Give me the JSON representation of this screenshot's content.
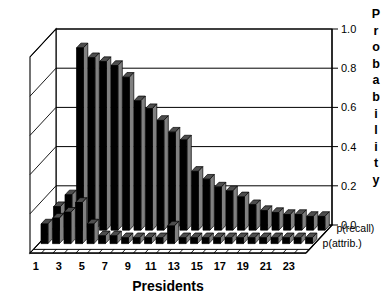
{
  "chart_data": {
    "type": "bar",
    "title": "",
    "subtitle": "",
    "xlabel": "Presidents",
    "ylabel": "Probability",
    "ylim": [
      0.0,
      1.0
    ],
    "yticks": [
      "1.0",
      "0.8",
      "0.6",
      "0.4",
      "0.2",
      "0.0"
    ],
    "ytick_values": [
      1.0,
      0.8,
      0.6,
      0.4,
      0.2,
      0.0
    ],
    "grid": true,
    "legend_position": "right-front (depth axis labels)",
    "projection": "3d",
    "depth_axis_labels": [
      "p(recall)",
      "p(attrib.)"
    ],
    "categories": [
      "1",
      "2",
      "3",
      "4",
      "5",
      "6",
      "7",
      "8",
      "9",
      "10",
      "11",
      "12",
      "13",
      "14",
      "15",
      "16",
      "17",
      "18",
      "19",
      "20",
      "21",
      "22",
      "23",
      "24"
    ],
    "xtick_labels": [
      "1",
      "3",
      "5",
      "7",
      "9",
      "11",
      "13",
      "15",
      "17",
      "19",
      "21",
      "23"
    ],
    "series": [
      {
        "name": "p(recall)",
        "values": [
          0.12,
          0.18,
          0.93,
          0.88,
          0.86,
          0.84,
          0.78,
          0.66,
          0.62,
          0.56,
          0.5,
          0.46,
          0.3,
          0.26,
          0.22,
          0.2,
          0.17,
          0.13,
          0.1,
          0.09,
          0.08,
          0.08,
          0.07,
          0.07
        ]
      },
      {
        "name": "p(attrib.)",
        "values": [
          0.1,
          0.13,
          0.16,
          0.21,
          0.1,
          0.04,
          0.04,
          0.03,
          0.03,
          0.03,
          0.03,
          0.09,
          0.03,
          0.03,
          0.03,
          0.03,
          0.03,
          0.03,
          0.03,
          0.03,
          0.03,
          0.03,
          0.03,
          0.03
        ]
      }
    ]
  },
  "colors": {
    "bar_front": "#000000",
    "bar_side": "#808080",
    "bar_top": "#4d4d4d",
    "front_row_fill": "#9a9a9a",
    "axis": "#000000",
    "grid": "#000000",
    "background": "#ffffff"
  },
  "axis": {
    "y_title": "Probability",
    "y_title_letters": [
      "P",
      "r",
      "o",
      "b",
      "a",
      "b",
      "i",
      "l",
      "i",
      "t",
      "y"
    ],
    "x_title": "Presidents"
  },
  "legend": {
    "back_label": "p(recall)",
    "front_label": "p(attrib.)"
  }
}
